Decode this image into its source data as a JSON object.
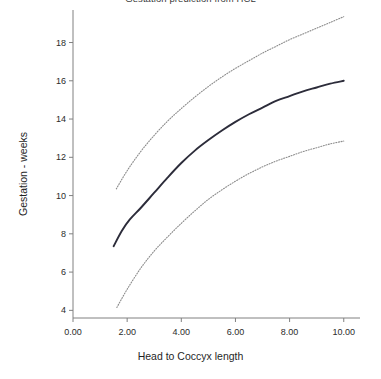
{
  "chart_data": {
    "type": "line",
    "title": "Gestation prediction from HCL",
    "xlabel": "Head to Coccyx length",
    "ylabel": "Gestation - weeks",
    "xlim": [
      0.0,
      10.6
    ],
    "ylim": [
      3.6,
      19.7
    ],
    "xticks": [
      "0.00",
      "2.00",
      "4.00",
      "6.00",
      "8.00",
      "10.00"
    ],
    "xtick_values": [
      0.0,
      2.0,
      4.0,
      6.0,
      8.0,
      10.0
    ],
    "yticks": [
      "4",
      "6",
      "8",
      "10",
      "12",
      "14",
      "16",
      "18"
    ],
    "ytick_values": [
      4,
      6,
      8,
      10,
      12,
      14,
      16,
      18
    ],
    "grid": false,
    "legend": "none",
    "spines": "left and bottom only",
    "series": [
      {
        "name": "Upper prediction limit",
        "style": "dotted",
        "color": "#8c8c8c",
        "x": [
          1.6,
          2.0,
          2.5,
          3.0,
          3.5,
          4.0,
          4.5,
          5.0,
          5.5,
          6.0,
          6.5,
          7.0,
          7.5,
          8.0,
          8.5,
          9.0,
          9.5,
          10.0
        ],
        "y": [
          10.35,
          11.3,
          12.3,
          13.15,
          13.9,
          14.55,
          15.15,
          15.7,
          16.2,
          16.65,
          17.05,
          17.45,
          17.8,
          18.15,
          18.45,
          18.75,
          19.05,
          19.35
        ]
      },
      {
        "name": "Predicted gestation",
        "style": "solid",
        "color": "#2c2c3a",
        "x": [
          1.5,
          1.8,
          2.1,
          2.5,
          3.0,
          3.5,
          4.0,
          4.5,
          5.0,
          5.5,
          6.0,
          6.5,
          7.0,
          7.5,
          8.0,
          8.5,
          9.0,
          9.5,
          10.0
        ],
        "y": [
          7.35,
          8.15,
          8.75,
          9.35,
          10.15,
          10.95,
          11.7,
          12.35,
          12.9,
          13.4,
          13.85,
          14.25,
          14.6,
          14.95,
          15.2,
          15.45,
          15.65,
          15.85,
          16.0
        ]
      },
      {
        "name": "Lower prediction limit",
        "style": "dotted",
        "color": "#8c8c8c",
        "x": [
          1.62,
          2.0,
          2.5,
          3.0,
          3.5,
          4.0,
          4.5,
          5.0,
          5.5,
          6.0,
          6.5,
          7.0,
          7.5,
          8.0,
          8.5,
          9.0,
          9.5,
          10.0
        ],
        "y": [
          4.15,
          5.1,
          6.2,
          7.1,
          7.85,
          8.55,
          9.2,
          9.8,
          10.3,
          10.75,
          11.15,
          11.5,
          11.8,
          12.05,
          12.3,
          12.5,
          12.7,
          12.85
        ]
      }
    ]
  }
}
